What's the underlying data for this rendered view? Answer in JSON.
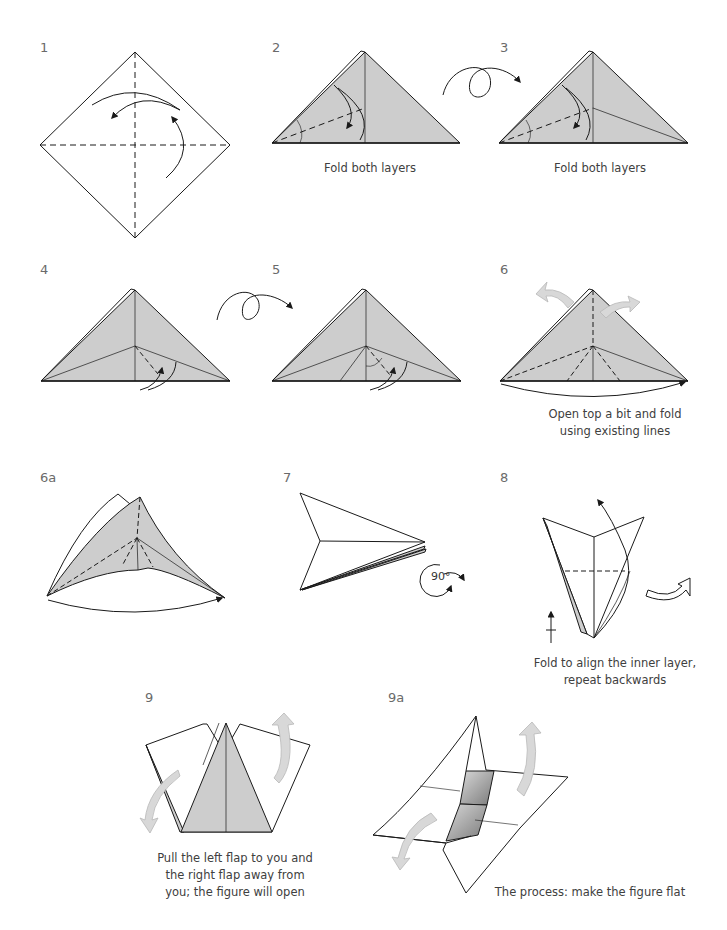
{
  "page": {
    "header_text": "",
    "fill_color": "#cdcdcd",
    "dark_fill_color": "#9a9a9a",
    "stroke_color": "#1a1a1a",
    "hollow_arrow_color": "#d8d8d8"
  },
  "steps": [
    {
      "number": "1",
      "caption": ""
    },
    {
      "number": "2",
      "caption": "Fold both layers"
    },
    {
      "number": "3",
      "caption": "Fold both layers"
    },
    {
      "number": "4",
      "caption": ""
    },
    {
      "number": "5",
      "caption": ""
    },
    {
      "number": "6",
      "caption_line1": "Open top a bit and fold",
      "caption_line2": "using existing lines"
    },
    {
      "number": "6a",
      "caption": ""
    },
    {
      "number": "7",
      "caption": "",
      "rotate_label": "90°"
    },
    {
      "number": "8",
      "caption_line1": "Fold to align the inner layer,",
      "caption_line2": "repeat backwards"
    },
    {
      "number": "9",
      "caption_line1": "Pull the left flap to you and",
      "caption_line2": "the right flap away from",
      "caption_line3": "you; the figure will open"
    },
    {
      "number": "9a",
      "caption": "The process: make the figure flat"
    }
  ]
}
